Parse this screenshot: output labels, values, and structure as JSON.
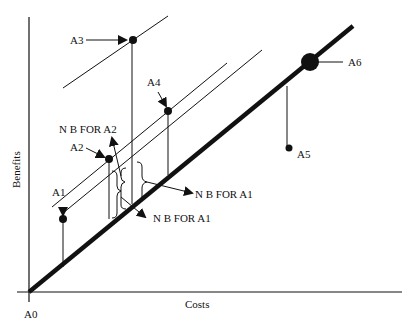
{
  "diagram": {
    "title": "",
    "axes": {
      "x_label": "Costs",
      "y_label": "Benefits",
      "origin_label": "A0"
    },
    "alternatives": [
      {
        "id": "A1",
        "label": "A1"
      },
      {
        "id": "A2",
        "label": "A2"
      },
      {
        "id": "A3",
        "label": "A3"
      },
      {
        "id": "A4",
        "label": "A4"
      },
      {
        "id": "A5",
        "label": "A5"
      },
      {
        "id": "A6",
        "label": "A6"
      }
    ],
    "annotations": {
      "nb_a2": "N B FOR A2",
      "nb_a1_upper": "N B FOR A1",
      "nb_a1_lower": "N B FOR A1"
    },
    "colors": {
      "ink": "#111111",
      "background": "#ffffff"
    }
  }
}
